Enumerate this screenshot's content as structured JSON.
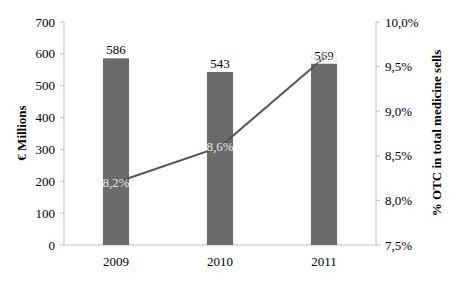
{
  "chart_data": {
    "type": "bar",
    "title": "",
    "categories": [
      "2009",
      "2010",
      "2011"
    ],
    "series": [
      {
        "name": "OTC sales (€ Millions)",
        "type": "bar",
        "axis": "left",
        "values": [
          586,
          543,
          569
        ],
        "labels": [
          "586",
          "543",
          "569"
        ],
        "color": "#6b6b6b"
      },
      {
        "name": "% OTC in total medicine sells",
        "type": "line",
        "axis": "right",
        "values": [
          8.2,
          8.6,
          9.6
        ],
        "labels": [
          "8,2%",
          "8,6%",
          "9,6%"
        ],
        "color": "#555555"
      }
    ],
    "xlabel": "",
    "ylabel": "€ Millions",
    "ylabel_right": "% OTC in total medicine sells",
    "ylim": [
      0,
      700
    ],
    "ylim_right": [
      7.5,
      10.0
    ],
    "yticks": [
      "0",
      "100",
      "200",
      "300",
      "400",
      "500",
      "600",
      "700"
    ],
    "yticks_right": [
      "7,5%",
      "8,0%",
      "8,5%",
      "9,0%",
      "9,5%",
      "10,0%"
    ],
    "grid": false,
    "legend": "none"
  }
}
